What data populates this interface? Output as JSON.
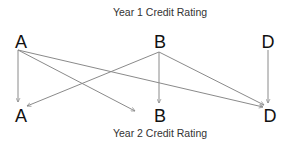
{
  "diagram": {
    "top_title": "Year 1 Credit Rating",
    "bottom_title": "Year 2 Credit Rating",
    "top_nodes": [
      {
        "id": "A1",
        "label": "A"
      },
      {
        "id": "B1",
        "label": "B"
      },
      {
        "id": "D1",
        "label": "D"
      }
    ],
    "bottom_nodes": [
      {
        "id": "A2",
        "label": "A"
      },
      {
        "id": "B2",
        "label": "B"
      },
      {
        "id": "D2",
        "label": "D"
      }
    ],
    "edges": [
      {
        "from": "A1",
        "to": "A2"
      },
      {
        "from": "A1",
        "to": "B2"
      },
      {
        "from": "A1",
        "to": "D2"
      },
      {
        "from": "B1",
        "to": "A2"
      },
      {
        "from": "B1",
        "to": "B2"
      },
      {
        "from": "B1",
        "to": "D2"
      },
      {
        "from": "D1",
        "to": "D2"
      }
    ],
    "colors": {
      "edge": "#8a8a8a",
      "node_text": "#111111",
      "title_text": "#333333"
    }
  }
}
